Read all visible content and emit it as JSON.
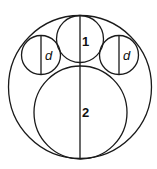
{
  "diagram": {
    "labels": {
      "circle_1": "1",
      "circle_2": "2",
      "left_small": "d",
      "right_small": "d"
    },
    "stroke_color": "#1a1a1a"
  }
}
